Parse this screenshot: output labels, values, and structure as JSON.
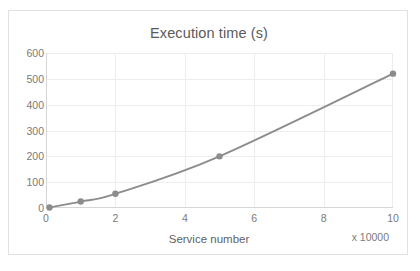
{
  "chart_data": {
    "type": "line",
    "title": "Execution time (s)",
    "xlabel": "Service number",
    "ylabel": "",
    "x_multiplier_note": "x 10000",
    "x": [
      0.1,
      1,
      2,
      5,
      10
    ],
    "values": [
      2,
      25,
      55,
      200,
      520
    ],
    "series": [
      {
        "name": "Execution time (s)",
        "x": [
          0.1,
          1,
          2,
          5,
          10
        ],
        "values": [
          2,
          25,
          55,
          200,
          520
        ]
      }
    ],
    "xlim": [
      0,
      10
    ],
    "ylim": [
      0,
      600
    ],
    "x_ticks": [
      "0",
      "2",
      "4",
      "6",
      "8",
      "10"
    ],
    "x_tick_values": [
      0,
      2,
      4,
      6,
      8,
      10
    ],
    "y_ticks": [
      "0",
      "100",
      "200",
      "300",
      "400",
      "500",
      "600"
    ],
    "y_tick_values": [
      0,
      100,
      200,
      300,
      400,
      500,
      600
    ],
    "grid": "horizontal-and-vertical",
    "legend": "none",
    "marker": "circle",
    "line_color": "#8c8c8c",
    "marker_color": "#8c8c8c",
    "grid_color": "#ededed",
    "axis_color": "#d6d6d6",
    "title_color": "#5a5a5a",
    "tick_label_color": "#7a7a7a"
  }
}
